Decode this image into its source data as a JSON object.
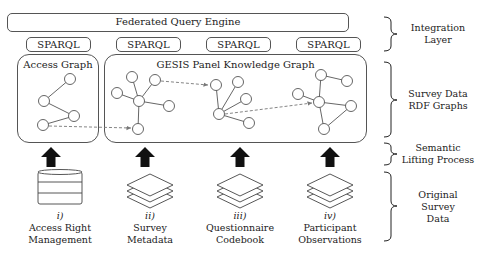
{
  "integration": {
    "engine_label": "Federated Query Engine",
    "sparql_endpoints": [
      "SPARQL",
      "SPARQL",
      "SPARQL",
      "SPARQL"
    ]
  },
  "graphs": {
    "access_graph_title": "Access Graph",
    "gesis_graph_title": "GESIS Panel Knowledge Graph"
  },
  "layers": [
    {
      "line1": "Integration",
      "line2": "Layer"
    },
    {
      "line1": "Survey Data",
      "line2": "RDF Graphs"
    },
    {
      "line1": "Semantic",
      "line2": "Lifting Process"
    },
    {
      "line1": "Original",
      "line2": "Survey",
      "line3": "Data"
    }
  ],
  "sources": [
    {
      "numeral": "i)",
      "line1": "Access Right",
      "line2": "Management",
      "icon": "database-icon"
    },
    {
      "numeral": "ii)",
      "line1": "Survey",
      "line2": "Metadata",
      "icon": "layers-icon"
    },
    {
      "numeral": "iii)",
      "line1": "Questionnaire",
      "line2": "Codebook",
      "icon": "layers-icon"
    },
    {
      "numeral": "iv)",
      "line1": "Participant",
      "line2": "Observations",
      "icon": "layers-icon"
    }
  ],
  "colors": {
    "stroke": "#555555",
    "text": "#222222",
    "arrow": "#111111",
    "dashed": "#777777"
  }
}
